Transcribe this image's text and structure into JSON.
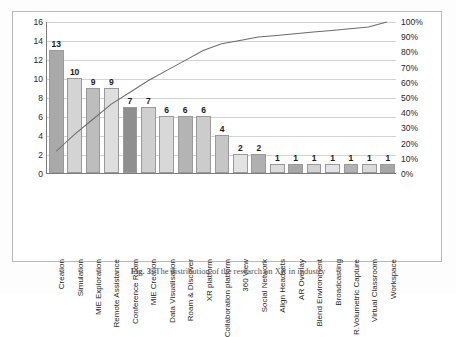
{
  "figure": {
    "caption_prefix": "Fig. 3.",
    "caption_text": "The distribution of the research on XR in industry"
  },
  "chart_data": {
    "type": "bar",
    "title": "",
    "xlabel": "",
    "ylabel": "",
    "y2label": "",
    "categories": [
      "Creation",
      "Simulation",
      "MiE Exploration",
      "Remote Assistance",
      "Conference Room",
      "MiE Creation",
      "Data Visualisation",
      "Roam & Discover",
      "XR platform",
      "Collaboration platform",
      "360 View",
      "Social Network",
      "Align Headsets",
      "AR Overlay",
      "Blend Environment",
      "Broadcasting",
      "R.Volumetric Capture",
      "Virtual Classroom",
      "Workspace"
    ],
    "values": [
      13,
      10,
      9,
      9,
      7,
      7,
      6,
      6,
      6,
      4,
      2,
      2,
      1,
      1,
      1,
      1,
      1,
      1,
      1
    ],
    "bar_shades": [
      "#a9a9a9",
      "#d4d4d4",
      "#bdbdbd",
      "#dedede",
      "#8f8f8f",
      "#cfcfcf",
      "#d8d8d8",
      "#b4b4b4",
      "#cccccc",
      "#c6c6c6",
      "#e2e2e2",
      "#b0b0b0",
      "#dcdcdc",
      "#a8a8a8",
      "#d2d2d2",
      "#e4e4e4",
      "#b2b2b2",
      "#dadada",
      "#a6a6a6"
    ],
    "cumulative_percent": [
      14.4,
      25.6,
      35.6,
      45.6,
      53.3,
      61.1,
      67.8,
      74.4,
      81.1,
      85.6,
      87.8,
      90.0,
      91.1,
      92.2,
      93.3,
      94.4,
      95.6,
      96.7,
      100.0
    ],
    "total": 90,
    "ylim": [
      0,
      16
    ],
    "y2lim": [
      0,
      100
    ],
    "yticks": [
      "0",
      "2",
      "4",
      "6",
      "8",
      "10",
      "12",
      "14",
      "16"
    ],
    "y2ticks": [
      "0%",
      "10%",
      "20%",
      "30%",
      "40%",
      "50%",
      "60%",
      "70%",
      "80%",
      "90%",
      "100%"
    ],
    "grid": true,
    "legend": "none",
    "line_color": "#6b6b6b",
    "bar_border_color": "#9a9a9a"
  }
}
